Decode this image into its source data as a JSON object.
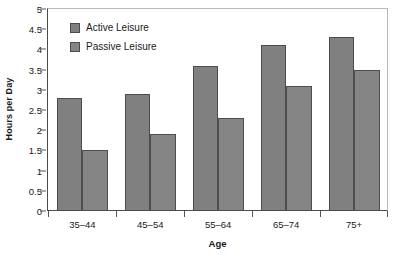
{
  "chart_data": {
    "type": "bar",
    "title": "",
    "xlabel": "Age",
    "ylabel": "Hours per Day",
    "categories": [
      "35–44",
      "45–54",
      "55–64",
      "65–74",
      "75+"
    ],
    "series": [
      {
        "name": "Active Leisure",
        "values": [
          2.8,
          2.9,
          3.6,
          4.1,
          4.3
        ],
        "color": "#808080"
      },
      {
        "name": "Passive Leisure",
        "values": [
          1.5,
          1.9,
          2.3,
          3.1,
          3.5
        ],
        "color": "#858585"
      }
    ],
    "ylim": [
      0,
      5
    ],
    "ytick_values": [
      0,
      0.5,
      1,
      1.5,
      2,
      2.5,
      3,
      3.5,
      4,
      4.5,
      5
    ],
    "ytick_labels": [
      "0",
      "0.5",
      "1",
      "1.5",
      "2",
      "2.5",
      "3",
      "3.5",
      "4",
      "4.5",
      "5"
    ],
    "grid": false,
    "legend_position": "top-left-inside",
    "bar_edge_color": "#4d4d4d",
    "axis_color": "#4a4a4a",
    "text_color": "#1a1a1a"
  }
}
